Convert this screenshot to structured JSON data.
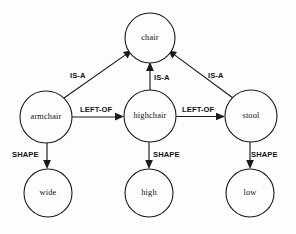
{
  "diagram": {
    "type": "semantic-network",
    "background_color": "#fdfdfd",
    "stroke_color": "#1a1a1a",
    "nodes": [
      {
        "id": "chair",
        "label": "chair",
        "cx": 150,
        "cy": 38,
        "r": 25,
        "row": "top"
      },
      {
        "id": "armchair",
        "label": "armchair",
        "cx": 46,
        "cy": 117,
        "r": 26,
        "row": "middle"
      },
      {
        "id": "highchair",
        "label": "highchair",
        "cx": 150,
        "cy": 116,
        "r": 26,
        "row": "middle"
      },
      {
        "id": "stool",
        "label": "stool",
        "cx": 251,
        "cy": 116,
        "r": 26,
        "row": "middle"
      },
      {
        "id": "wide",
        "label": "wide",
        "cx": 48,
        "cy": 193,
        "r": 24,
        "row": "bottom"
      },
      {
        "id": "high",
        "label": "high",
        "cx": 149,
        "cy": 193,
        "r": 24,
        "row": "bottom"
      },
      {
        "id": "low",
        "label": "low",
        "cx": 250,
        "cy": 193,
        "r": 24,
        "row": "bottom"
      }
    ],
    "edges": [
      {
        "id": "armchair-isa-chair",
        "from": "armchair",
        "to": "chair",
        "label": "IS-A",
        "label_x": 70,
        "label_y": 78
      },
      {
        "id": "highchair-isa-chair",
        "from": "highchair",
        "to": "chair",
        "label": "IS-A",
        "label_x": 154,
        "label_y": 80
      },
      {
        "id": "stool-isa-chair",
        "from": "stool",
        "to": "chair",
        "label": "IS-A",
        "label_x": 208,
        "label_y": 78
      },
      {
        "id": "armchair-leftof-highchair",
        "from": "armchair",
        "to": "highchair",
        "label": "LEFT-OF",
        "label_x": 80,
        "label_y": 112
      },
      {
        "id": "highchair-leftof-stool",
        "from": "highchair",
        "to": "stool",
        "label": "LEFT-OF",
        "label_x": 182,
        "label_y": 112
      },
      {
        "id": "armchair-shape-wide",
        "from": "armchair",
        "to": "wide",
        "label": "SHAPE",
        "label_x": 12,
        "label_y": 157
      },
      {
        "id": "highchair-shape-high",
        "from": "highchair",
        "to": "high",
        "label": "SHAPE",
        "label_x": 153,
        "label_y": 157
      },
      {
        "id": "stool-shape-low",
        "from": "stool",
        "to": "low",
        "label": "SHAPE",
        "label_x": 251,
        "label_y": 157
      }
    ]
  }
}
